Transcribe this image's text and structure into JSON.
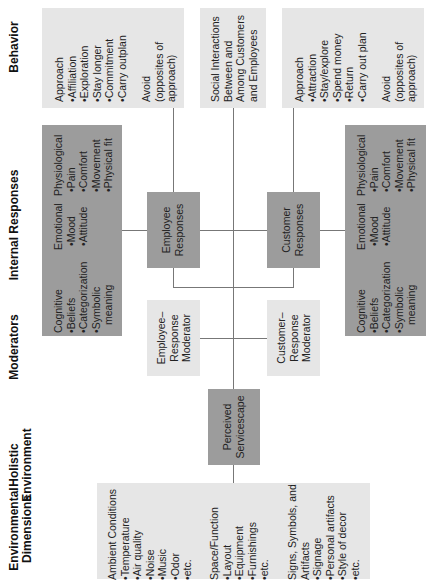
{
  "columns": {
    "behavior": "Behavior",
    "internal_responses": "Internal Responses",
    "moderators": "Moderators",
    "holistic_line1": "Holistic",
    "holistic_line2": "Environment",
    "environmental_line1": "Environmental",
    "environmental_line2": "Dimensions"
  },
  "behavior": {
    "employee": {
      "approach": "Approach",
      "items": [
        "Affiliation",
        "Exploration",
        "Stay longer",
        "Commitment",
        "Carry outplan"
      ],
      "avoid_lines": [
        "Avoid",
        "(opposites of",
        "approach)"
      ]
    },
    "social": [
      "Social Interactions",
      "Between and",
      "Among Customers",
      "and Employees"
    ],
    "customer": {
      "approach": "Approach",
      "items": [
        "Attraction",
        "Stay/explore",
        "Spend money",
        "Return",
        "Carry out plan"
      ],
      "avoid_lines": [
        "Avoid",
        "(opposites of",
        "approach)"
      ]
    }
  },
  "internal": {
    "cognitive": {
      "title": "Cognitive",
      "items": [
        "Beliefs",
        "Categorization",
        "Symbolic"
      ],
      "cont": "meaning"
    },
    "emotional": {
      "title": "Emotional",
      "items": [
        "Mood",
        "Attitude"
      ]
    },
    "physiological": {
      "title": "Physiological",
      "items": [
        "Pain",
        "Comfort",
        "Movement",
        "Physical fit"
      ]
    }
  },
  "responses": {
    "employee": [
      "Employee",
      "Responses"
    ],
    "customer": [
      "Customer",
      "Responses"
    ]
  },
  "moderators": {
    "employee": [
      "Employee–",
      "Response",
      "Moderator"
    ],
    "customer": [
      "Customer–",
      "Response",
      "Moderator"
    ]
  },
  "servicescape": [
    "Perceived",
    "Servicescape"
  ],
  "environment": {
    "ambient": {
      "title": "Ambient Conditions",
      "items": [
        "Temperature",
        "Air quality",
        "Noise",
        "Music",
        "Odor",
        "etc."
      ]
    },
    "space": {
      "title": "Space/Function",
      "items": [
        "Layout",
        "Equipment",
        "Furnishings",
        "etc."
      ]
    },
    "signs": {
      "title_lines": [
        "Signs, Symbols, and",
        "Artifacts"
      ],
      "items": [
        "Signage",
        "Personal artifacts",
        "Style of decor",
        "etc."
      ]
    }
  },
  "colors": {
    "light_box": "#e6e6e6",
    "dark_box": "#9c9c9c",
    "line": "#777777"
  }
}
